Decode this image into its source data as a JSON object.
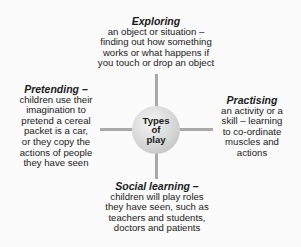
{
  "diagram": {
    "center": {
      "label_lines": [
        "Types",
        "of",
        "play"
      ]
    },
    "nodes": {
      "top": {
        "title": "Exploring",
        "lines": [
          "an object or situation –",
          "finding out how something",
          "works or what happens if",
          "you touch or drop an object"
        ]
      },
      "left": {
        "title": "Pretending –",
        "lines": [
          "children use their",
          "imagination to",
          "pretend a cereal",
          "packet is a car,",
          "or they copy the",
          "actions of people",
          "they have seen"
        ]
      },
      "right": {
        "title": "Practising",
        "lines": [
          "an activity or a",
          "skill – learning",
          "to co-ordinate",
          "muscles and",
          "actions"
        ]
      },
      "bottom": {
        "title": "Social learning –",
        "lines": [
          "children will play roles",
          "they have seen, such as",
          "teachers and students,",
          "doctors and patients"
        ]
      }
    },
    "colors": {
      "connector": "#a9a9a9",
      "hub": "#d6d6d6",
      "text": "#1a1a1a"
    }
  }
}
